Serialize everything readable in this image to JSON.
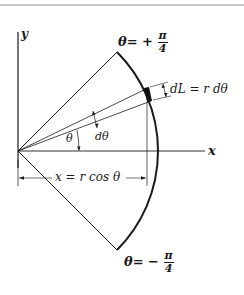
{
  "figure": {
    "axes": {
      "x_label": "x",
      "y_label": "y"
    },
    "labels": {
      "theta_top_prefix": "θ= +",
      "theta_top_num": "π",
      "theta_top_den": "4",
      "theta_bottom_prefix": "θ= −",
      "theta_bottom_num": "π",
      "theta_bottom_den": "4",
      "arc_element": "dL = r dθ",
      "theta": "θ",
      "dtheta": "dθ",
      "x_projection": "x = r cos θ"
    },
    "geometry": {
      "origin": [
        18,
        151
      ],
      "radius": 140,
      "sector_half_angle_deg": 45,
      "element_angles_deg": [
        21,
        26
      ]
    },
    "colors": {
      "ink": "#1a1a1a",
      "background": "#ffffff"
    }
  }
}
